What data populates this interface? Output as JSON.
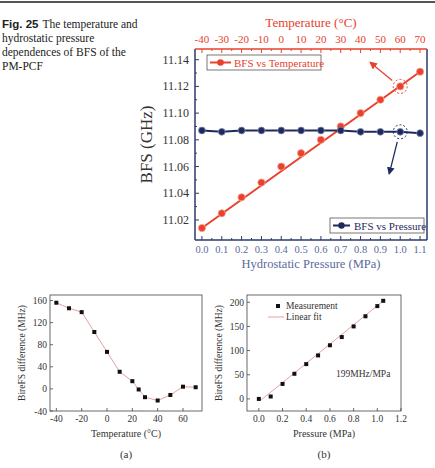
{
  "caption": {
    "label": "Fig. 25",
    "text": "The temperature and hydrostatic pressure dependences of BFS of the PM-PCF"
  },
  "colors": {
    "temperature": "#e8412c",
    "pressure": "#1f2a5c",
    "fit_line": "#e8a0a0",
    "axis": "#2b3a6b"
  },
  "chart_data": [
    {
      "id": "main",
      "type": "line",
      "title": "",
      "ylabel": "BFS (GHz)",
      "xlabel_bottom": "Hydrostatic Pressure (MPa)",
      "xlabel_top": "Temperature (°C)",
      "x_bottom_ticks": [
        "0.0",
        "0.1",
        "0.2",
        "0.3",
        "0.4",
        "0.5",
        "0.6",
        "0.7",
        "0.8",
        "0.9",
        "1.0",
        "1.1"
      ],
      "x_top_ticks": [
        "-40",
        "-30",
        "-20",
        "-10",
        "0",
        "10",
        "20",
        "30",
        "40",
        "50",
        "60",
        "70"
      ],
      "y_ticks": [
        "11.02",
        "11.04",
        "11.06",
        "11.08",
        "11.10",
        "11.12",
        "11.14"
      ],
      "ylim": [
        11.005,
        11.148
      ],
      "series": [
        {
          "name": "BFS vs Temperature",
          "axis": "top",
          "x": [
            -40,
            -30,
            -20,
            -10,
            0,
            10,
            20,
            30,
            40,
            50,
            60,
            70
          ],
          "values": [
            11.014,
            11.025,
            11.037,
            11.048,
            11.06,
            11.07,
            11.08,
            11.09,
            11.1,
            11.11,
            11.12,
            11.131
          ]
        },
        {
          "name": "BFS vs Pressure",
          "axis": "bottom",
          "x": [
            0.0,
            0.1,
            0.2,
            0.3,
            0.4,
            0.5,
            0.6,
            0.7,
            0.8,
            0.9,
            1.0,
            1.1
          ],
          "values": [
            11.087,
            11.086,
            11.087,
            11.087,
            11.087,
            11.087,
            11.087,
            11.087,
            11.086,
            11.086,
            11.086,
            11.085
          ]
        }
      ],
      "legend": [
        "BFS vs Temperature",
        "BFS vs Pressure"
      ]
    },
    {
      "id": "a",
      "type": "line",
      "panel_label": "(a)",
      "xlabel": "Temperature (°C)",
      "ylabel": "BireFS difference (MHz)",
      "x_ticks": [
        "-40",
        "-20",
        "0",
        "20",
        "40",
        "60"
      ],
      "y_ticks": [
        "-40",
        "0",
        "40",
        "80",
        "120",
        "160"
      ],
      "xlim": [
        -45,
        75
      ],
      "ylim": [
        -40,
        170
      ],
      "x": [
        -40,
        -30,
        -20,
        -10,
        0,
        10,
        20,
        25,
        30,
        40,
        50,
        60,
        70
      ],
      "values": [
        156,
        146,
        139,
        103,
        67,
        31,
        14,
        -1,
        -15,
        -21,
        -11,
        4,
        3
      ]
    },
    {
      "id": "b",
      "type": "scatter",
      "panel_label": "(b)",
      "xlabel": "Pressure (MPa)",
      "ylabel": "BireFS difference (MHz)",
      "x_ticks": [
        "0.0",
        "0.2",
        "0.4",
        "0.6",
        "0.8",
        "1.0",
        "1.2"
      ],
      "y_ticks": [
        "0",
        "50",
        "100",
        "150",
        "200"
      ],
      "xlim": [
        -0.1,
        1.2
      ],
      "ylim": [
        -25,
        215
      ],
      "annotation": "199MHz/MPa",
      "legend": [
        "Measurement",
        "Linear fit"
      ],
      "x": [
        0.0,
        0.1,
        0.2,
        0.3,
        0.4,
        0.5,
        0.6,
        0.7,
        0.8,
        0.9,
        1.0,
        1.05
      ],
      "values": [
        0,
        5,
        31,
        52,
        72,
        90,
        111,
        128,
        150,
        171,
        192,
        203
      ],
      "fit": {
        "slope": 199,
        "intercept": -6
      }
    }
  ]
}
